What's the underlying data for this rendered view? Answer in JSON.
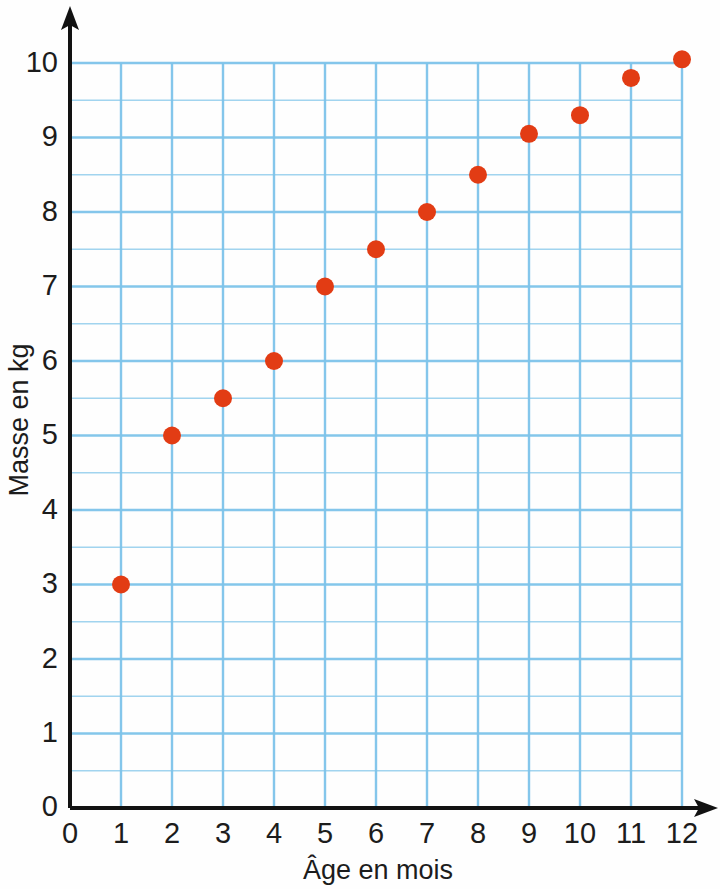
{
  "chart_data": {
    "type": "scatter",
    "title": "",
    "xlabel": "Âge en mois",
    "ylabel": "Masse en kg",
    "xlim": [
      0,
      12
    ],
    "ylim": [
      0,
      10.5
    ],
    "xticks": [
      "0",
      "1",
      "2",
      "3",
      "4",
      "5",
      "6",
      "7",
      "8",
      "9",
      "10",
      "11",
      "12"
    ],
    "yticks": [
      "0",
      "1",
      "2",
      "3",
      "4",
      "5",
      "6",
      "7",
      "8",
      "9",
      "10"
    ],
    "grid": {
      "visible": true,
      "color": "#7ec4ea",
      "x_step": 1,
      "y_step": 0.5
    },
    "origin_label": "0",
    "legend": null,
    "marker": {
      "shape": "circle",
      "color": "#e23c14",
      "radius": 9
    },
    "axis_color": "#121212",
    "series": [
      {
        "name": "Masse du nourrisson",
        "x": [
          1,
          2,
          3,
          4,
          5,
          6,
          7,
          8,
          9,
          10,
          11,
          12
        ],
        "values": [
          3,
          5,
          5.5,
          6,
          7,
          7.5,
          8,
          8.5,
          9.05,
          9.3,
          9.8,
          10.05
        ]
      }
    ],
    "points": [
      {
        "x": 1,
        "y": 3
      },
      {
        "x": 2,
        "y": 5
      },
      {
        "x": 3,
        "y": 5.5
      },
      {
        "x": 4,
        "y": 6
      },
      {
        "x": 5,
        "y": 7
      },
      {
        "x": 6,
        "y": 7.5
      },
      {
        "x": 7,
        "y": 8
      },
      {
        "x": 8,
        "y": 8.5
      },
      {
        "x": 9,
        "y": 9.05
      },
      {
        "x": 10,
        "y": 9.3
      },
      {
        "x": 11,
        "y": 9.8
      },
      {
        "x": 12,
        "y": 10.05
      }
    ]
  }
}
